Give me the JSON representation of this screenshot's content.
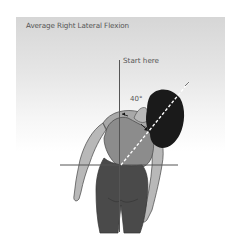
{
  "diagram": {
    "title": "Average Right Lateral Flexion",
    "start_label": "Start here",
    "angle_label": "40°",
    "colors": {
      "panel_top": "#d6d6d6",
      "panel_bottom": "#ffffff",
      "hair": "#1a1a1a",
      "skin": "#b8b8b8",
      "top": "#8c8c8c",
      "pants": "#4a4a4a",
      "lines": "#555555",
      "spine_dash": "#ffffff"
    }
  }
}
